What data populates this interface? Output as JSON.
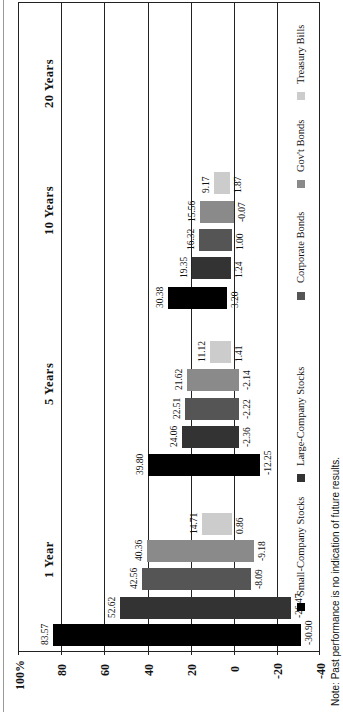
{
  "chart_data": {
    "type": "bar",
    "subtype": "floating-range",
    "orientation": "rotated-90",
    "title": "",
    "xlabel": "",
    "ylabel": "",
    "ylim": [
      -40,
      100
    ],
    "y_ticks": [
      "100%",
      "80",
      "60",
      "40",
      "20",
      "0",
      "-20",
      "-40"
    ],
    "categories": [
      "1 Year",
      "5 Years",
      "10 Years",
      "20 Years"
    ],
    "series": [
      {
        "name": "Small-Company Stocks",
        "color": "#000000",
        "high": [
          83.57,
          39.8,
          30.38,
          null
        ],
        "low": [
          -30.9,
          -12.25,
          3.2,
          null
        ]
      },
      {
        "name": "Large-Company Stocks",
        "color": "#333333",
        "high": [
          52.62,
          24.06,
          19.35,
          null
        ],
        "low": [
          -26.47,
          -2.36,
          1.24,
          null
        ]
      },
      {
        "name": "Corporate Bonds",
        "color": "#555555",
        "high": [
          42.56,
          22.51,
          16.32,
          null
        ],
        "low": [
          -8.09,
          -2.22,
          1.0,
          null
        ]
      },
      {
        "name": "Gov't Bonds",
        "color": "#8a8a8a",
        "high": [
          40.36,
          21.62,
          15.56,
          null
        ],
        "low": [
          -9.18,
          -2.14,
          -0.07,
          null
        ]
      },
      {
        "name": "Treasury Bills",
        "color": "#cccccc",
        "high": [
          14.71,
          11.12,
          9.17,
          null
        ],
        "low": [
          0.86,
          1.41,
          1.87,
          null
        ]
      }
    ],
    "grid": true,
    "legend_position": "bottom"
  },
  "labels": {
    "high": {
      "g0": [
        "83.57",
        "52.62",
        "42.56",
        "40.36",
        "14.71"
      ],
      "g1": [
        "39.80",
        "24.06",
        "22.51",
        "21.62",
        "11.12"
      ],
      "g2": [
        "30.38",
        "19.35",
        "16.32",
        "15.56",
        "9.17"
      ]
    },
    "low": {
      "g0": [
        "-30.90",
        "-26.47",
        "-8.09",
        "-9.18",
        "0.86"
      ],
      "g1": [
        "-12.25",
        "-2.36",
        "-2.22",
        "-2.14",
        "1.41"
      ],
      "g2": [
        "3.20",
        "1.24",
        "1.00",
        "-0.07",
        "1.87"
      ]
    }
  },
  "axis": {
    "t100": "100%",
    "t80": "80",
    "t60": "60",
    "t40": "40",
    "t20": "20",
    "t0": "0",
    "tm20": "-20",
    "tm40": "-40"
  },
  "groups": {
    "g0": "1 Year",
    "g1": "5 Years",
    "g2": "10 Years",
    "g3": "20 Years"
  },
  "legend": {
    "small": "Small-Company Stocks",
    "large": "Large-Company Stocks",
    "corp": "Corporate Bonds",
    "gov": "Gov't Bonds",
    "tbill": "Treasury Bills"
  },
  "note": "Note: Past performance is no indication of future results."
}
